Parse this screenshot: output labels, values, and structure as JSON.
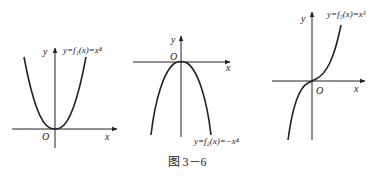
{
  "figure": {
    "caption": "图 3－6",
    "panels": [
      {
        "id": "f1",
        "function_label": "y=f₁(x)=x⁴",
        "x_axis_label": "x",
        "y_axis_label": "y",
        "origin_label": "O",
        "shape": "even quartic opening upward"
      },
      {
        "id": "f2",
        "function_label": "y=f₂(x)=−x⁴",
        "x_axis_label": "x",
        "y_axis_label": "y",
        "origin_label": "O",
        "shape": "even quartic opening downward"
      },
      {
        "id": "f3",
        "function_label": "y=f₃(x)=x³",
        "x_axis_label": "x",
        "y_axis_label": "y",
        "origin_label": "O",
        "shape": "odd cubic through origin"
      }
    ]
  },
  "colors": {
    "ink": "#222222",
    "background": "#ffffff"
  }
}
